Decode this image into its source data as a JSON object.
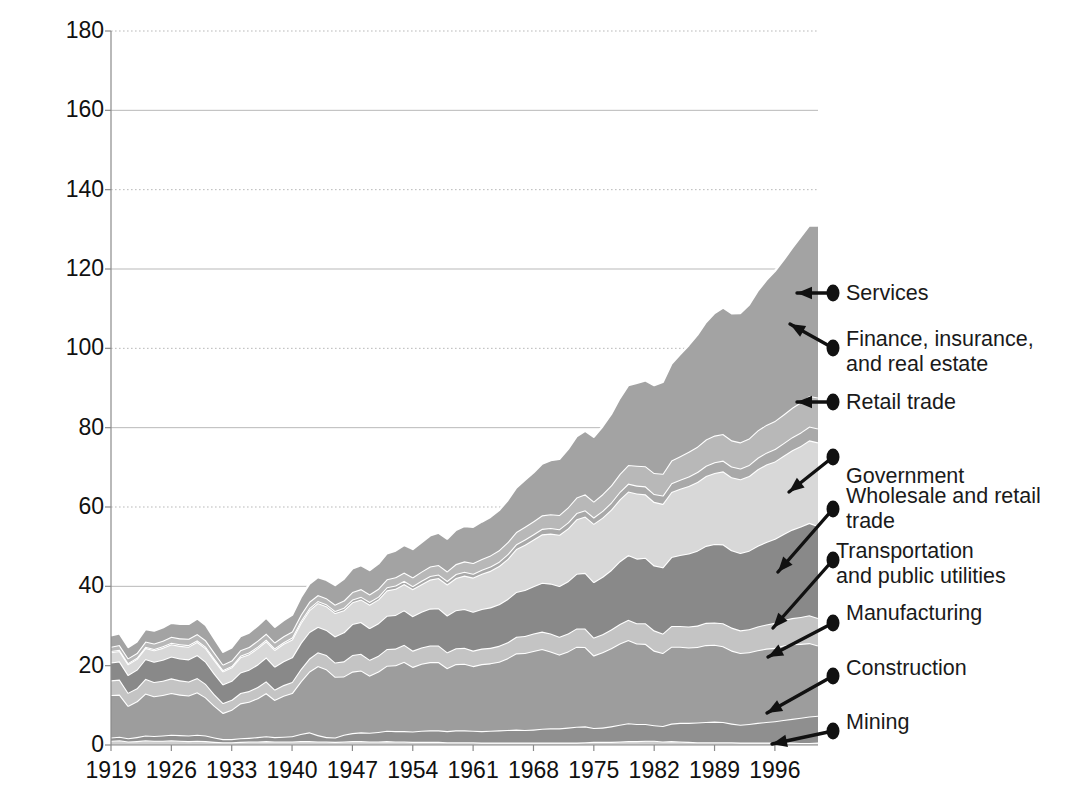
{
  "chart_data": {
    "type": "area",
    "title": "",
    "subtitle": "",
    "xlabel": "",
    "ylabel": "Millions",
    "stacked": true,
    "grid": true,
    "legend_position": "right-callouts",
    "xlim": [
      1919,
      2001
    ],
    "ylim": [
      0,
      180
    ],
    "ytick_values": [
      0,
      20,
      40,
      60,
      80,
      100,
      120,
      140,
      160,
      180
    ],
    "ytick_labels": [
      "0",
      "20",
      "40",
      "60",
      "80",
      "100",
      "120",
      "140",
      "160",
      "180"
    ],
    "xtick_values": [
      1919,
      1926,
      1933,
      1940,
      1947,
      1954,
      1961,
      1968,
      1975,
      1982,
      1989,
      1996
    ],
    "xtick_labels": [
      "1919",
      "1926",
      "1933",
      "1940",
      "1947",
      "1954",
      "1961",
      "1968",
      "1975",
      "1982",
      "1989",
      "1996"
    ],
    "x": [
      1919,
      1920,
      1921,
      1922,
      1923,
      1924,
      1925,
      1926,
      1927,
      1928,
      1929,
      1930,
      1931,
      1932,
      1933,
      1934,
      1935,
      1936,
      1937,
      1938,
      1939,
      1940,
      1941,
      1942,
      1943,
      1944,
      1945,
      1946,
      1947,
      1948,
      1949,
      1950,
      1951,
      1952,
      1953,
      1954,
      1955,
      1956,
      1957,
      1958,
      1959,
      1960,
      1961,
      1962,
      1963,
      1964,
      1965,
      1966,
      1967,
      1968,
      1969,
      1970,
      1971,
      1972,
      1973,
      1974,
      1975,
      1976,
      1977,
      1978,
      1979,
      1980,
      1981,
      1982,
      1983,
      1984,
      1985,
      1986,
      1987,
      1988,
      1989,
      1990,
      1991,
      1992,
      1993,
      1994,
      1995,
      1996,
      1997,
      1998,
      1999,
      2000,
      2001
    ],
    "series": [
      {
        "name": "Mining",
        "color": "#cfcfcf",
        "values": [
          1.1,
          1.2,
          0.9,
          1.0,
          1.2,
          1.1,
          1.1,
          1.2,
          1.1,
          1.0,
          1.1,
          1.0,
          0.8,
          0.7,
          0.7,
          0.8,
          0.9,
          0.9,
          1.0,
          0.9,
          0.9,
          0.9,
          1.0,
          1.0,
          0.9,
          0.9,
          0.8,
          0.9,
          1.0,
          1.0,
          0.9,
          0.9,
          1.0,
          0.9,
          0.9,
          0.8,
          0.8,
          0.8,
          0.8,
          0.7,
          0.7,
          0.7,
          0.7,
          0.6,
          0.6,
          0.6,
          0.6,
          0.6,
          0.6,
          0.6,
          0.6,
          0.6,
          0.6,
          0.6,
          0.6,
          0.7,
          0.8,
          0.8,
          0.8,
          0.9,
          1.0,
          1.0,
          1.1,
          1.1,
          0.9,
          1.0,
          0.9,
          0.8,
          0.7,
          0.7,
          0.7,
          0.7,
          0.7,
          0.6,
          0.6,
          0.6,
          0.6,
          0.6,
          0.6,
          0.6,
          0.5,
          0.5,
          0.6
        ]
      },
      {
        "name": "Construction",
        "color": "#8f8f8f",
        "values": [
          0.8,
          0.9,
          0.8,
          1.0,
          1.2,
          1.2,
          1.3,
          1.4,
          1.4,
          1.4,
          1.5,
          1.4,
          1.1,
          0.8,
          0.8,
          0.9,
          0.9,
          1.1,
          1.2,
          1.1,
          1.2,
          1.3,
          1.8,
          2.2,
          1.6,
          1.1,
          1.1,
          1.7,
          2.0,
          2.2,
          2.2,
          2.4,
          2.6,
          2.6,
          2.6,
          2.6,
          2.8,
          2.9,
          2.9,
          2.8,
          3.0,
          3.0,
          2.9,
          2.9,
          3.0,
          3.1,
          3.2,
          3.3,
          3.2,
          3.3,
          3.5,
          3.6,
          3.6,
          3.8,
          4.0,
          4.0,
          3.5,
          3.6,
          3.9,
          4.2,
          4.5,
          4.3,
          4.2,
          3.9,
          3.9,
          4.4,
          4.7,
          4.8,
          5.0,
          5.1,
          5.2,
          5.1,
          4.7,
          4.5,
          4.7,
          5.0,
          5.2,
          5.4,
          5.7,
          6.0,
          6.4,
          6.7,
          6.8
        ]
      },
      {
        "name": "Manufacturing",
        "color": "#9d9d9d",
        "values": [
          10.7,
          10.6,
          8.2,
          9.0,
          10.6,
          10.0,
          10.2,
          10.5,
          10.2,
          10.1,
          10.7,
          9.6,
          8.0,
          6.6,
          7.4,
          8.8,
          9.1,
          9.8,
          10.9,
          9.4,
          10.3,
          10.9,
          13.2,
          15.3,
          17.4,
          17.1,
          15.3,
          14.7,
          15.5,
          15.6,
          14.4,
          15.2,
          16.4,
          16.6,
          17.5,
          16.3,
          16.9,
          17.2,
          17.2,
          15.9,
          16.7,
          16.8,
          16.3,
          16.9,
          17.0,
          17.3,
          18.1,
          19.2,
          19.4,
          19.8,
          20.1,
          19.4,
          18.6,
          19.2,
          20.2,
          20.0,
          18.3,
          19.0,
          19.7,
          20.5,
          21.0,
          20.3,
          20.2,
          18.8,
          18.4,
          19.4,
          19.2,
          19.0,
          19.0,
          19.4,
          19.4,
          19.1,
          18.4,
          18.1,
          18.1,
          18.3,
          18.5,
          18.5,
          18.8,
          18.8,
          18.6,
          18.5,
          17.7
        ]
      },
      {
        "name": "Transportation and public utilities",
        "color": "#c4c4c4",
        "values": [
          3.7,
          3.8,
          3.3,
          3.3,
          3.7,
          3.6,
          3.6,
          3.7,
          3.6,
          3.5,
          3.6,
          3.4,
          2.9,
          2.5,
          2.5,
          2.6,
          2.7,
          2.8,
          3.0,
          2.6,
          2.7,
          2.8,
          3.1,
          3.3,
          3.5,
          3.6,
          3.6,
          3.8,
          4.2,
          4.2,
          4.0,
          4.0,
          4.2,
          4.2,
          4.3,
          4.1,
          4.1,
          4.2,
          4.2,
          4.0,
          4.0,
          4.0,
          3.9,
          3.9,
          3.9,
          4.0,
          4.0,
          4.2,
          4.3,
          4.4,
          4.4,
          4.5,
          4.5,
          4.5,
          4.6,
          4.7,
          4.5,
          4.5,
          4.7,
          4.9,
          5.1,
          5.1,
          5.2,
          5.1,
          4.9,
          5.2,
          5.2,
          5.3,
          5.4,
          5.6,
          5.6,
          5.8,
          5.8,
          5.7,
          5.8,
          6.0,
          6.1,
          6.3,
          6.4,
          6.6,
          6.8,
          7.0,
          6.9
        ]
      },
      {
        "name": "Wholesale and retail trade",
        "color": "#898989",
        "values": [
          4.5,
          4.6,
          4.5,
          4.7,
          5.0,
          5.1,
          5.3,
          5.5,
          5.5,
          5.6,
          5.8,
          5.6,
          5.2,
          4.7,
          4.8,
          5.2,
          5.4,
          5.7,
          6.0,
          5.8,
          6.0,
          6.2,
          6.6,
          6.7,
          6.4,
          6.3,
          6.6,
          7.3,
          7.8,
          8.0,
          8.0,
          8.2,
          8.4,
          8.5,
          8.7,
          8.7,
          9.0,
          9.3,
          9.4,
          9.3,
          9.6,
          9.8,
          9.8,
          10.0,
          10.2,
          10.5,
          10.9,
          11.3,
          11.6,
          11.9,
          12.3,
          12.6,
          12.8,
          13.2,
          13.8,
          14.0,
          14.0,
          14.5,
          15.0,
          15.8,
          16.3,
          16.3,
          16.5,
          16.4,
          16.7,
          17.4,
          17.9,
          18.4,
          18.9,
          19.4,
          19.8,
          19.9,
          19.5,
          19.5,
          19.8,
          20.3,
          20.8,
          21.2,
          21.7,
          22.3,
          22.8,
          23.3,
          23.2
        ]
      },
      {
        "name": "Government",
        "color": "#d8d8d8",
        "values": [
          2.6,
          2.6,
          2.7,
          2.7,
          2.8,
          2.9,
          3.0,
          3.1,
          3.2,
          3.2,
          3.3,
          3.4,
          3.4,
          3.3,
          3.4,
          3.8,
          3.9,
          4.1,
          4.1,
          4.2,
          4.4,
          4.5,
          5.0,
          5.5,
          6.0,
          6.0,
          5.9,
          5.6,
          5.5,
          5.7,
          5.9,
          6.0,
          6.4,
          6.6,
          6.6,
          6.8,
          6.9,
          7.3,
          7.6,
          7.8,
          8.1,
          8.4,
          8.6,
          8.9,
          9.2,
          9.6,
          10.1,
          10.8,
          11.4,
          11.8,
          12.2,
          12.6,
          12.9,
          13.3,
          13.7,
          14.2,
          14.7,
          14.9,
          15.2,
          15.6,
          16.0,
          16.4,
          16.0,
          16.0,
          16.0,
          16.4,
          16.7,
          17.0,
          17.3,
          17.6,
          17.9,
          18.4,
          18.4,
          18.6,
          18.8,
          19.3,
          19.5,
          19.5,
          19.7,
          20.0,
          20.3,
          20.8,
          21.1
        ]
      },
      {
        "name": "Retail trade",
        "color": "#a9a9a9",
        "values": [
          0.3,
          0.3,
          0.3,
          0.3,
          0.3,
          0.3,
          0.4,
          0.4,
          0.4,
          0.4,
          0.4,
          0.4,
          0.4,
          0.3,
          0.3,
          0.4,
          0.4,
          0.4,
          0.4,
          0.4,
          0.4,
          0.5,
          0.5,
          0.5,
          0.5,
          0.5,
          0.5,
          0.6,
          0.7,
          0.7,
          0.7,
          0.7,
          0.8,
          0.8,
          0.8,
          0.8,
          0.9,
          0.9,
          0.9,
          0.9,
          1.0,
          1.0,
          1.0,
          1.0,
          1.1,
          1.1,
          1.2,
          1.2,
          1.3,
          1.3,
          1.4,
          1.4,
          1.4,
          1.5,
          1.6,
          1.6,
          1.6,
          1.7,
          1.8,
          1.9,
          2.0,
          2.0,
          2.0,
          2.0,
          2.1,
          2.2,
          2.3,
          2.4,
          2.5,
          2.6,
          2.7,
          2.7,
          2.7,
          2.7,
          2.8,
          2.9,
          3.0,
          3.1,
          3.2,
          3.3,
          3.4,
          3.5,
          3.5
        ]
      },
      {
        "name": "Finance, insurance, and real estate",
        "color": "#b8b8b8",
        "values": [
          1.1,
          1.2,
          1.2,
          1.2,
          1.3,
          1.4,
          1.4,
          1.5,
          1.5,
          1.6,
          1.6,
          1.6,
          1.5,
          1.4,
          1.4,
          1.4,
          1.4,
          1.5,
          1.5,
          1.5,
          1.5,
          1.5,
          1.6,
          1.6,
          1.5,
          1.5,
          1.6,
          1.8,
          1.9,
          1.9,
          1.9,
          2.0,
          2.0,
          2.1,
          2.1,
          2.2,
          2.3,
          2.4,
          2.4,
          2.4,
          2.5,
          2.6,
          2.7,
          2.7,
          2.8,
          2.9,
          3.0,
          3.1,
          3.2,
          3.3,
          3.4,
          3.5,
          3.6,
          3.8,
          3.9,
          4.0,
          4.0,
          4.2,
          4.3,
          4.5,
          4.7,
          5.0,
          5.1,
          5.3,
          5.5,
          5.7,
          5.9,
          6.2,
          6.4,
          6.6,
          6.7,
          6.7,
          6.6,
          6.6,
          6.7,
          6.9,
          7.0,
          7.1,
          7.2,
          7.4,
          7.6,
          7.7,
          7.8
        ]
      },
      {
        "name": "Services",
        "color": "#a3a3a3",
        "values": [
          2.8,
          2.9,
          2.8,
          2.9,
          3.1,
          3.2,
          3.3,
          3.5,
          3.6,
          3.7,
          3.9,
          3.8,
          3.5,
          3.2,
          3.3,
          3.5,
          3.6,
          3.8,
          4.0,
          3.9,
          4.0,
          4.2,
          4.4,
          4.5,
          4.5,
          4.6,
          4.9,
          5.5,
          5.9,
          6.0,
          6.1,
          6.3,
          6.5,
          6.7,
          6.9,
          7.1,
          7.4,
          7.8,
          8.1,
          8.2,
          8.6,
          8.9,
          9.1,
          9.4,
          9.7,
          10.1,
          10.6,
          11.2,
          11.8,
          12.3,
          13.0,
          13.6,
          14.1,
          14.7,
          15.4,
          16.0,
          16.3,
          17.1,
          18.0,
          19.1,
          20.1,
          20.9,
          21.6,
          22.1,
          23.1,
          24.4,
          25.7,
          26.9,
          28.2,
          29.6,
          30.9,
          31.9,
          32.0,
          32.6,
          33.7,
          35.2,
          36.5,
          37.8,
          39.0,
          40.3,
          41.8,
          43.0,
          43.3
        ]
      }
    ],
    "callouts": [
      {
        "label": "Services",
        "label_lines": [
          "Services"
        ]
      },
      {
        "label": "Finance, insurance, and real estate",
        "label_lines": [
          "Finance, insurance,",
          "and real estate"
        ]
      },
      {
        "label": "Retail trade",
        "label_lines": [
          "Retail trade"
        ]
      },
      {
        "label": "Government",
        "label_lines": [
          "Government"
        ]
      },
      {
        "label": "Wholesale and retail trade",
        "label_lines": [
          "Wholesale and retail",
          "trade"
        ]
      },
      {
        "label": "Transportation and public utilities",
        "label_lines": [
          "Transportation",
          "and public utilities"
        ]
      },
      {
        "label": "Manufacturing",
        "label_lines": [
          "Manufacturing"
        ]
      },
      {
        "label": "Construction",
        "label_lines": [
          "Construction"
        ]
      },
      {
        "label": "Mining",
        "label_lines": [
          "Mining"
        ]
      }
    ]
  },
  "axis": {
    "y_title": "Millions"
  }
}
